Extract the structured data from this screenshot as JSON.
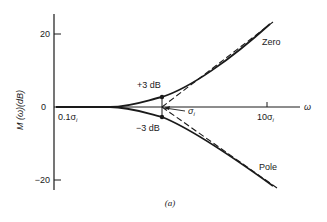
{
  "figure": {
    "caption": "(a)",
    "y_axis": {
      "label": "M (ω)(dB)",
      "ticks": [
        {
          "value": 20,
          "label": "20"
        },
        {
          "value": 0,
          "label": "0"
        },
        {
          "value": -20,
          "label": "−20"
        }
      ]
    },
    "x_axis": {
      "label": "ω",
      "ticks": [
        {
          "label": "0.1σ",
          "subscript": "i"
        },
        {
          "label": "10σ",
          "subscript": "i"
        }
      ]
    },
    "annotations": {
      "plus3": "+3 dB",
      "minus3": "−3 dB",
      "corner_sym": "σ",
      "corner_sub": "i"
    },
    "curves": {
      "zero_label": "Zero",
      "pole_label": "Pole"
    },
    "colors": {
      "ink": "#1a1a1a",
      "background": "#ffffff"
    }
  }
}
